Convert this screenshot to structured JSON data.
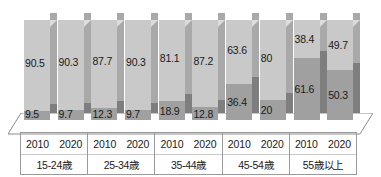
{
  "chart_data": {
    "type": "bar",
    "subtype": "100% stacked 3D column",
    "title": "",
    "xlabel": "",
    "ylabel": "",
    "ylim": [
      0,
      100
    ],
    "grid": false,
    "legend_position": "none",
    "categories": [
      "2010 / 15-24歳",
      "2020 / 15-24歳",
      "2010 / 25-34歳",
      "2020 / 25-34歳",
      "2010 / 35-44歳",
      "2020 / 35-44歳",
      "2010 / 45-54歳",
      "2020 / 45-54歳",
      "2010 / 55歳以上",
      "2020 / 55歳以上"
    ],
    "series": [
      {
        "name": "upper-segment",
        "color": "#c9c9c9",
        "values": [
          90.5,
          90.3,
          87.7,
          90.3,
          81.1,
          87.2,
          63.6,
          80,
          38.4,
          49.7
        ]
      },
      {
        "name": "lower-segment",
        "color": "#a0a0a0",
        "values": [
          9.5,
          9.7,
          12.3,
          9.7,
          18.9,
          12.8,
          36.4,
          20,
          61.6,
          50.3
        ]
      }
    ],
    "groups": [
      {
        "name": "15-24歳",
        "years": [
          "2010",
          "2020"
        ],
        "bars": [
          {
            "year": "2010",
            "top": "90.5",
            "bottom": "9.5"
          },
          {
            "year": "2020",
            "top": "90.3",
            "bottom": "9.7"
          }
        ]
      },
      {
        "name": "25-34歳",
        "years": [
          "2010",
          "2020"
        ],
        "bars": [
          {
            "year": "2010",
            "top": "87.7",
            "bottom": "12.3"
          },
          {
            "year": "2020",
            "top": "90.3",
            "bottom": "9.7"
          }
        ]
      },
      {
        "name": "35-44歳",
        "years": [
          "2010",
          "2020"
        ],
        "bars": [
          {
            "year": "2010",
            "top": "81.1",
            "bottom": "18.9"
          },
          {
            "year": "2020",
            "top": "87.2",
            "bottom": "12.8"
          }
        ]
      },
      {
        "name": "45-54歳",
        "years": [
          "2010",
          "2020"
        ],
        "bars": [
          {
            "year": "2010",
            "top": "63.6",
            "bottom": "36.4"
          },
          {
            "year": "2020",
            "top": "80",
            "bottom": "20"
          }
        ]
      },
      {
        "name": "55歳以上",
        "years": [
          "2010",
          "2020"
        ],
        "bars": [
          {
            "year": "2010",
            "top": "38.4",
            "bottom": "61.6"
          },
          {
            "year": "2020",
            "top": "49.7",
            "bottom": "50.3"
          }
        ]
      }
    ],
    "colors": {
      "upper_front": "#c9c9c9",
      "upper_side": "#a9a9a9",
      "lower_front": "#a0a0a0",
      "lower_side": "#7e7e7e",
      "cap": "#ddddda",
      "floor": "#ffffff",
      "floor_stroke": "#8c8c8c",
      "table_border": "#9a9a9a",
      "text": "#1a1a1a",
      "background": "#ffffff"
    }
  }
}
